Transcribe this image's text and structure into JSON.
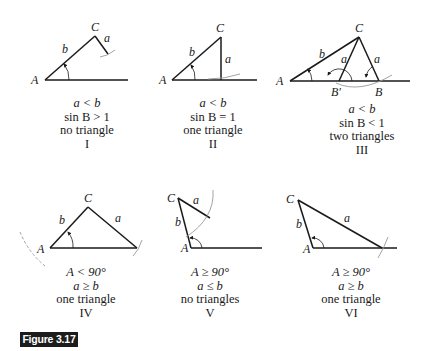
{
  "figure": {
    "label": "Figure 3.17",
    "label_bg": "#1c1c1c",
    "label_fg": "#ffffff"
  },
  "panels": [
    {
      "id": "I",
      "vertices": {
        "A": "A",
        "C": "C"
      },
      "sides": {
        "a": "a",
        "b": "b"
      },
      "caption": [
        "a < b",
        "sin B > 1",
        "no triangle",
        "I"
      ]
    },
    {
      "id": "II",
      "vertices": {
        "A": "A",
        "C": "C"
      },
      "sides": {
        "a": "a",
        "b": "b"
      },
      "caption": [
        "a < b",
        "sin B = 1",
        "one triangle",
        "II"
      ]
    },
    {
      "id": "III",
      "vertices": {
        "A": "A",
        "C": "C",
        "B": "B",
        "B_prime": "B′"
      },
      "sides": {
        "a": "a",
        "b": "b"
      },
      "caption": [
        "a < b",
        "sin B < 1",
        "two triangles",
        "III"
      ]
    },
    {
      "id": "IV",
      "vertices": {
        "A": "A",
        "C": "C"
      },
      "sides": {
        "a": "a",
        "b": "b"
      },
      "caption": [
        "A < 90°",
        "a ≥ b",
        "one triangle",
        "IV"
      ]
    },
    {
      "id": "V",
      "vertices": {
        "A": "A",
        "C": "C"
      },
      "sides": {
        "a": "a",
        "b": "b"
      },
      "caption": [
        "A ≥ 90°",
        "a ≤ b",
        "no triangles",
        "V"
      ]
    },
    {
      "id": "VI",
      "vertices": {
        "A": "A",
        "C": "C"
      },
      "sides": {
        "a": "a",
        "b": "b"
      },
      "caption": [
        "A ≥ 90°",
        "a ≥ b",
        "one triangle",
        "VI"
      ]
    }
  ]
}
